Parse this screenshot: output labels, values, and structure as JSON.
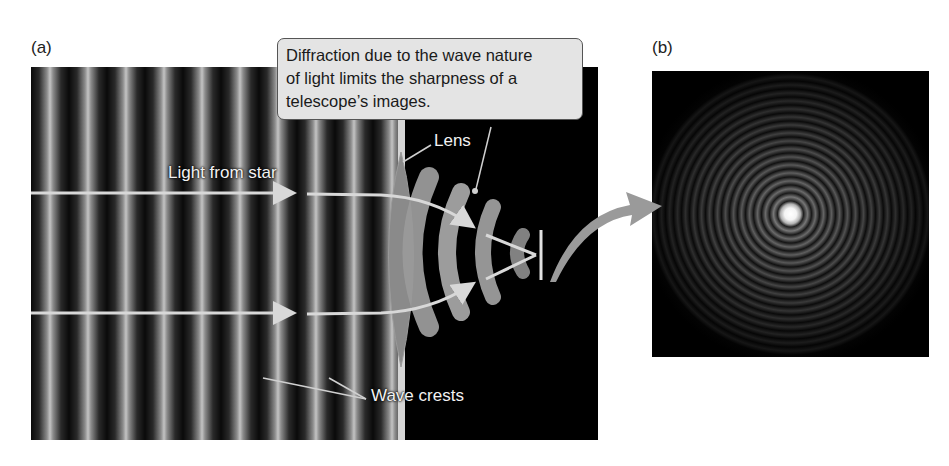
{
  "figure": {
    "panel_a": {
      "label": "(a)",
      "callout_text": "Diffraction due to the wave nature of light limits the sharpness of a telescope's images.",
      "callout_lines": [
        "Diffraction due to the wave nature",
        "of light limits the sharpness of a",
        "telescope’s images."
      ],
      "labels": {
        "light_from_star": "Light from star",
        "lens": "Lens",
        "wave_crests": "Wave crests"
      },
      "colors": {
        "background": "#000000",
        "wave_crest": "#c4c4c4",
        "lens": "#8a8a8a",
        "arrow": "#d8d8d8",
        "callout_bg": "#e4e4e4"
      }
    },
    "panel_b": {
      "label": "(b)",
      "description": "Airy diffraction pattern: bright central spot surrounded by concentric rings"
    }
  }
}
